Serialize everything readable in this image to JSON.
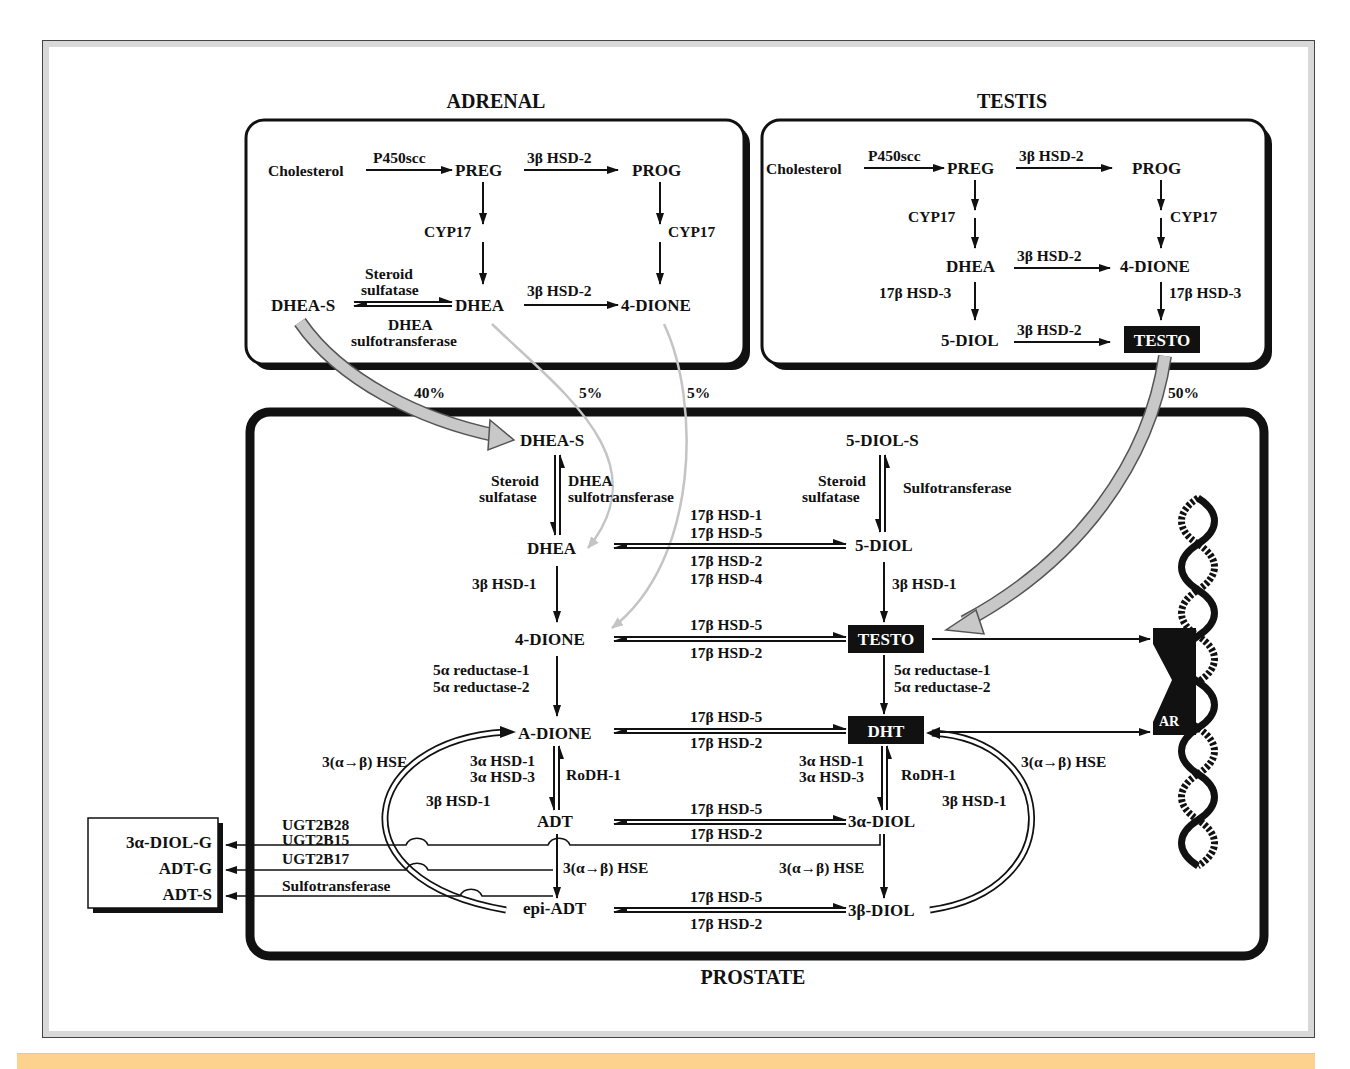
{
  "organs": {
    "adrenal": "ADRENAL",
    "testis": "TESTIS",
    "prostate": "PROSTATE"
  },
  "adrenal": {
    "cholesterol": "Cholesterol",
    "p450scc": "P450scc",
    "preg": "PREG",
    "hsd2_top": "3β HSD-2",
    "prog": "PROG",
    "cyp17_left": "CYP17",
    "cyp17_right": "CYP17",
    "dheas": "DHEA-S",
    "steroid": "Steroid",
    "sulfatase": "sulfatase",
    "dhea": "DHEA",
    "dhea_label": "DHEA",
    "sulfotransferase": "sulfotransferase",
    "hsd2_bottom": "3β HSD-2",
    "dione": "4-DIONE"
  },
  "testis": {
    "cholesterol": "Cholesterol",
    "p450scc": "P450scc",
    "preg": "PREG",
    "hsd2_top": "3β HSD-2",
    "prog": "PROG",
    "cyp17_left": "CYP17",
    "cyp17_right": "CYP17",
    "dhea": "DHEA",
    "hsd2_mid": "3β HSD-2",
    "dione": "4-DIONE",
    "hsd3_left": "17β HSD-3",
    "hsd3_right": "17β HSD-3",
    "diol": "5-DIOL",
    "hsd2_bottom": "3β HSD-2",
    "testo": "TESTO"
  },
  "contributions": {
    "dheas_pct": "40%",
    "dhea_pct": "5%",
    "dione_pct": "5%",
    "testo_pct": "50%"
  },
  "prostate": {
    "dheas": "DHEA-S",
    "steroid1": "Steroid",
    "sulfatase1": "sulfatase",
    "dhea_sulfo1": "DHEA",
    "dhea_sulfo2": "sulfotransferase",
    "diols": "5-DIOL-S",
    "steroid2": "Steroid",
    "sulfatase2": "sulfatase",
    "sulfotransferase": "Sulfotransferase",
    "dhea": "DHEA",
    "diol5": "5-DIOL",
    "hsd_fwd1": "17β HSD-1",
    "hsd_fwd2": "17β HSD-5",
    "hsd_rev1": "17β HSD-2",
    "hsd_rev2": "17β HSD-4",
    "hsd1_left": "3β HSD-1",
    "hsd1_right": "3β HSD-1",
    "dione": "4-DIONE",
    "testo": "TESTO",
    "dione_fwd": "17β HSD-5",
    "dione_rev": "17β HSD-2",
    "red1_left": "5α reductase-1",
    "red2_left": "5α reductase-2",
    "red1_right": "5α reductase-1",
    "red2_right": "5α reductase-2",
    "adione": "A-DIONE",
    "dht": "DHT",
    "adione_fwd": "17β HSD-5",
    "adione_rev": "17β HSD-2",
    "hse_left": "3(α→β) HSE",
    "hse_right": "3(α→β) HSE",
    "a_hsd1_l": "3α HSD-1",
    "a_hsd3_l": "3α HSD-3",
    "rodh_l": "RoDH-1",
    "a_hsd1_r": "3α HSD-1",
    "a_hsd3_r": "3α HSD-3",
    "rodh_r": "RoDH-1",
    "b_hsd1_l": "3β HSD-1",
    "b_hsd1_r": "3β HSD-1",
    "adt": "ADT",
    "diol3a": "3α-DIOL",
    "adt_fwd": "17β HSD-5",
    "adt_rev": "17β HSD-2",
    "ugt2b28": "UGT2B28",
    "ugt2b15": "UGT2B15",
    "ugt2b17": "UGT2B17",
    "sulfo_out": "Sulfotransferase",
    "hse_mid_l": "3(α→β) HSE",
    "hse_mid_r": "3(α→β) HSE",
    "epiadt": "epi-ADT",
    "diol3b": "3β-DIOL",
    "epi_fwd": "17β HSD-5",
    "epi_rev": "17β HSD-2",
    "ar": "AR"
  },
  "excretion": {
    "diolg": "3α-DIOL-G",
    "adtg": "ADT-G",
    "adts": "ADT-S"
  },
  "colors": {
    "ink": "#111111",
    "gray_arrow": "#bdbdbd",
    "frame_border": "#d8d8d8",
    "footer_band": "#fcd28e"
  }
}
